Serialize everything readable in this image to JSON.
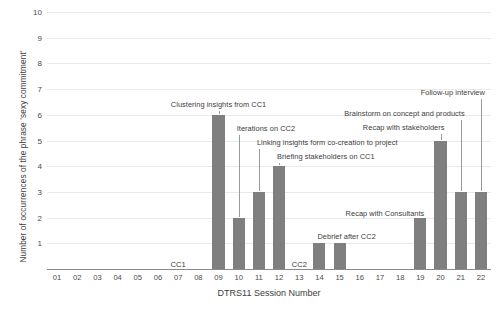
{
  "chart_data": {
    "type": "bar",
    "title": "",
    "xlabel": "DTRS11 Session Number",
    "ylabel": "Number of occurrences of the phrase 'sexy commitment'",
    "categories": [
      "01",
      "02",
      "03",
      "04",
      "05",
      "06",
      "07",
      "08",
      "09",
      "10",
      "11",
      "12",
      "13",
      "14",
      "15",
      "16",
      "17",
      "18",
      "19",
      "20",
      "21",
      "22"
    ],
    "values": [
      0,
      0,
      0,
      0,
      0,
      0,
      0,
      0,
      6,
      2,
      3,
      4,
      0,
      1,
      1,
      0,
      0,
      0,
      2,
      5,
      3,
      3
    ],
    "ylim": [
      0,
      10
    ],
    "ytick_labels": [
      "1",
      "2",
      "3",
      "4",
      "5",
      "6",
      "7",
      "8",
      "9",
      "10"
    ],
    "ytick_values": [
      1,
      2,
      3,
      4,
      5,
      6,
      7,
      8,
      9,
      10
    ],
    "grid": true,
    "legend": "none",
    "bar_color": "#7f7f7f",
    "gridline_color": "#e9e9e9",
    "axis_color": "#8a8a8a",
    "annotations": [
      {
        "text": "Clustering insights from CC1",
        "session": "09",
        "value": 6
      },
      {
        "text": "Iterations on CC2",
        "session": "10",
        "value": 2
      },
      {
        "text": "Linking insights form co-creation to project",
        "session": "11",
        "value": 3
      },
      {
        "text": "Briefing stakeholders on CC1",
        "session": "12",
        "value": 4
      },
      {
        "text": "Debrief after CC2",
        "session": "14",
        "value": 1
      },
      {
        "text": "Recap with Consultants",
        "session": "19",
        "value": 2
      },
      {
        "text": "Recap with stakeholders",
        "session": "20",
        "value": 5
      },
      {
        "text": "Brainstorm on concept and products",
        "session": "21",
        "value": 3
      },
      {
        "text": "Follow-up interview",
        "session": "22",
        "value": 3
      }
    ],
    "phase_markers": [
      {
        "label": "CC1",
        "session": "07"
      },
      {
        "label": "CC2",
        "session": "13"
      }
    ]
  }
}
